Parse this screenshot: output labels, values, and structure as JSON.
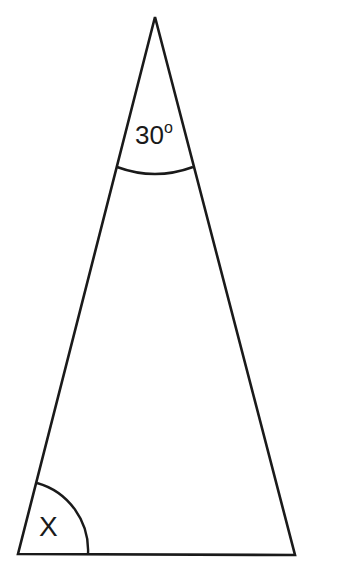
{
  "diagram": {
    "type": "isosceles-triangle",
    "stroke_color": "#1a1a1a",
    "background_color": "#ffffff",
    "vertices": {
      "apex": [
        155,
        17
      ],
      "bottom_left": [
        18,
        554
      ],
      "bottom_right": [
        295,
        555
      ]
    },
    "angles": [
      {
        "vertex": "apex",
        "value_text": "30",
        "unit_symbol": "o",
        "arc_radius": 155
      },
      {
        "vertex": "bottom_left",
        "value_text": "X",
        "arc_radius": 70
      }
    ]
  }
}
